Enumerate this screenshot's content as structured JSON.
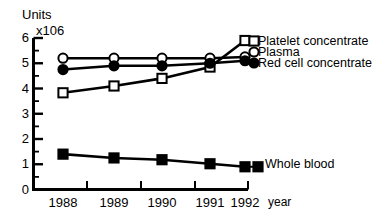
{
  "chart_data": {
    "type": "line",
    "title": "",
    "ylabel": "Units",
    "y_axis_multiplier": "x106",
    "xlabel": "year",
    "categories": [
      "1988",
      "1989",
      "1990",
      "1991",
      "1992"
    ],
    "ylim": [
      0,
      6
    ],
    "yticks": [
      "0",
      "1",
      "2",
      "3",
      "4",
      "5",
      "6"
    ],
    "minor_ticks": true,
    "grid": false,
    "legend_position": "line-end-labels",
    "series": [
      {
        "name": "Platelet concentrate",
        "marker": "open-square",
        "values": [
          3.83,
          4.1,
          4.4,
          4.85,
          5.9
        ]
      },
      {
        "name": "Plasma",
        "marker": "open-circle",
        "values": [
          5.2,
          5.2,
          5.2,
          5.2,
          5.25
        ]
      },
      {
        "name": "Red cell concentrate",
        "marker": "filled-circle",
        "values": [
          4.75,
          4.9,
          4.9,
          5.0,
          5.1
        ]
      },
      {
        "name": "Whole blood",
        "marker": "filled-square",
        "values": [
          1.4,
          1.25,
          1.18,
          1.02,
          0.9
        ]
      }
    ]
  },
  "axis": {
    "y_title_line1": "Units",
    "y_title_line2": "x106",
    "x_title": "year"
  },
  "labels": {
    "platelet": "Platelet concentrate",
    "plasma": "Plasma",
    "redcell": "Red cell concentrate",
    "wholeblood": "Whole blood"
  },
  "colors": {
    "ink": "#000000",
    "background": "#ffffff"
  }
}
